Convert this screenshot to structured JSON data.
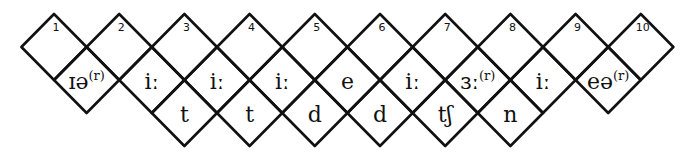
{
  "diagram": {
    "line_color": "#111111",
    "background": "#ffffff",
    "geometry": {
      "x0": 54,
      "step": 65.2,
      "half_w": 32.6,
      "half_h": 33,
      "row_y": [
        47,
        80,
        113
      ]
    },
    "top_row": {
      "numbers": [
        "1",
        "2",
        "3",
        "4",
        "5",
        "6",
        "7",
        "8",
        "9",
        "10"
      ]
    },
    "middle_row": {
      "cells": [
        {
          "base": "ɪə",
          "sup": "(r)"
        },
        {
          "base": "iː",
          "sup": ""
        },
        {
          "base": "iː",
          "sup": ""
        },
        {
          "base": "iː",
          "sup": ""
        },
        {
          "base": "e",
          "sup": ""
        },
        {
          "base": "iː",
          "sup": ""
        },
        {
          "base": "ɜː",
          "sup": "(r)"
        },
        {
          "base": "iː",
          "sup": ""
        },
        {
          "base": "eə",
          "sup": "(r)"
        }
      ]
    },
    "bottom_row": {
      "start_index": 2,
      "cells": [
        "t",
        "t",
        "d",
        "d",
        "tʃ",
        "n"
      ]
    }
  }
}
